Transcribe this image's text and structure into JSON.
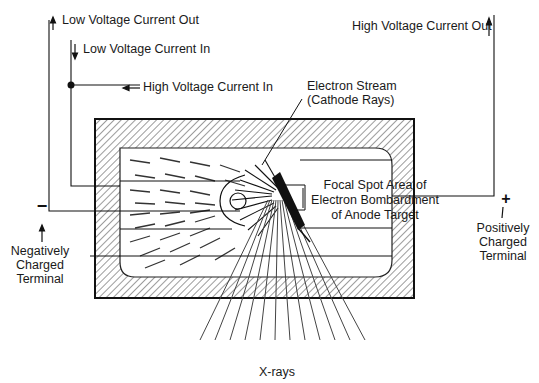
{
  "diagram": {
    "labels": {
      "low_voltage_out": "Low Voltage Current Out",
      "low_voltage_in": "Low Voltage Current In",
      "high_voltage_in": "High Voltage Current In",
      "high_voltage_out": "High Voltage Current Out",
      "electron_stream_line1": "Electron Stream",
      "electron_stream_line2": "(Cathode Rays)",
      "focal_spot_line1": "Focal Spot Area of",
      "focal_spot_line2": "Electron Bombardment",
      "focal_spot_line3": "of Anode Target",
      "negative_symbol": "−",
      "negative_line1": "Negatively",
      "negative_line2": "Charged",
      "negative_line3": "Terminal",
      "positive_symbol": "+",
      "positive_line1": "Positively",
      "positive_line2": "Charged",
      "positive_line3": "Terminal",
      "xrays": "X-rays"
    },
    "colors": {
      "ink": "#111111",
      "hatch": "#3a3a3a",
      "background": "#ffffff"
    }
  }
}
